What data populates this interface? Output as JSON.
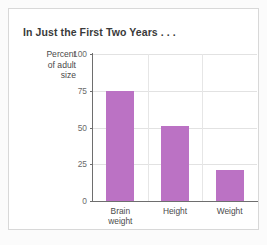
{
  "chart_data": {
    "type": "bar",
    "title": "In Just the First Two Years . . .",
    "xlabel": "",
    "ylabel": "Percent\nof adult\nsize",
    "ylabel_lines": [
      "Percent",
      "of adult",
      "size"
    ],
    "categories": [
      "Brain\nweight",
      "Height",
      "Weight"
    ],
    "category_labels": [
      "Brain weight",
      "Height",
      "Weight"
    ],
    "values": [
      75,
      51,
      21
    ],
    "ylim": [
      0,
      100
    ],
    "yticks": [
      0,
      25,
      50,
      75,
      100
    ],
    "ytick_labels": [
      "0",
      "25",
      "50",
      "75",
      "100"
    ],
    "grid": true,
    "legend": false,
    "bar_color": "#bb72c4"
  },
  "chart": {
    "title": "In Just the First Two Years . . .",
    "y_axis_title_lines": [
      "Percent",
      "of adult",
      "size"
    ],
    "y_ticks": [
      {
        "label": "100",
        "value": 100
      },
      {
        "label": "75",
        "value": 75
      },
      {
        "label": "50",
        "value": 50
      },
      {
        "label": "25",
        "value": 25
      },
      {
        "label": "0",
        "value": 0
      }
    ],
    "bars": [
      {
        "label": "Brain\nweight",
        "value": 75
      },
      {
        "label": "Height",
        "value": 51
      },
      {
        "label": "Weight",
        "value": 21
      }
    ]
  }
}
